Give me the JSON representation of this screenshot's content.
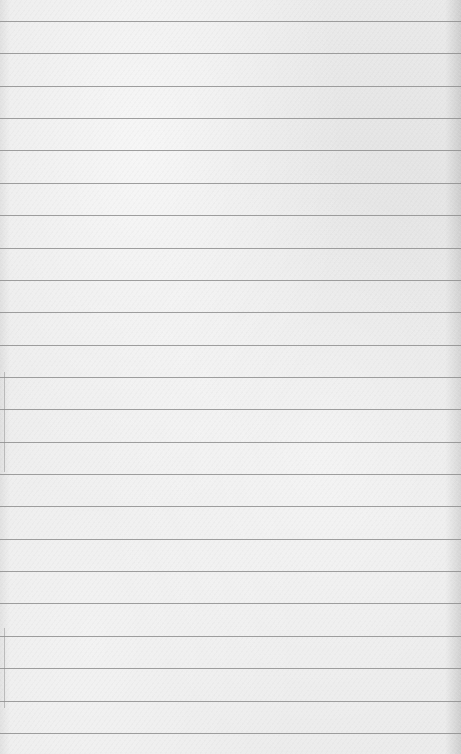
{
  "page": {
    "type": "lined-paper",
    "width": 461,
    "height": 754,
    "background_color": "#ebebeb",
    "line_color": "#8e8e8e",
    "line_count": 23,
    "first_line_y": 21,
    "line_spacing": 32.36,
    "content_text": []
  }
}
